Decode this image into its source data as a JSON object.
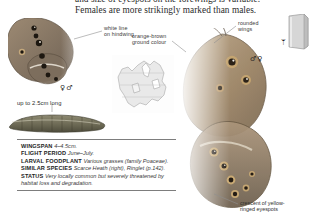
{
  "page": {
    "intro_paragraph": "and size of eyespots on the forewings is variable. Females are more strikingly marked than males."
  },
  "callouts": [
    {
      "id": "white-line",
      "text": "white line\non hindwing"
    },
    {
      "id": "orange-brown",
      "text": "orange-brown\nground colour"
    },
    {
      "id": "rounded-wings",
      "text": "rounded\nwings"
    },
    {
      "id": "crescent-eyespots",
      "text": "crescent of yellow-\nringed eyespots"
    }
  ],
  "size_label": "up to 2.5cm long",
  "sex_symbols": {
    "left_pair": "♀♂",
    "right_pair": "♂♀"
  },
  "icons": {
    "book": "book-icon",
    "moth": "ᛘ"
  },
  "fact_box": [
    {
      "key": "WINGSPAN",
      "value": "4–4.5cm."
    },
    {
      "key": "FLIGHT PERIOD",
      "value": "June–July."
    },
    {
      "key": "LARVAL FOODPLANT",
      "value": "Various grasses (family Poaceae)."
    },
    {
      "key": "SIMILAR SPECIES",
      "value": "Scarce Heath (right), Ringlet (p.142)."
    },
    {
      "key": "STATUS",
      "value": "Very locally common but severely threatened by habitat loss and degradation."
    }
  ],
  "colors": {
    "ink": "#232323",
    "wing_brown": "#8d7a63",
    "wing_orange": "#b9936a",
    "rule": "#7d7d7d"
  }
}
